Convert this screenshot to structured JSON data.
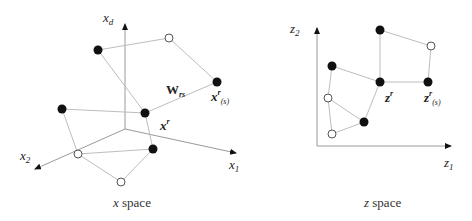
{
  "x_space": {
    "caption": "x space",
    "axes": {
      "xd": {
        "label": "x",
        "sub": "d"
      },
      "x1": {
        "label": "x",
        "sub": "1"
      },
      "x2": {
        "label": "x",
        "sub": "2"
      }
    },
    "weight_label": {
      "text": "W",
      "sub": "rs"
    },
    "xr_label": {
      "text": "x",
      "sup": "r"
    },
    "xrs_label": {
      "text": "x",
      "sup": "r",
      "sub": "(s)"
    }
  },
  "z_space": {
    "caption": "z space",
    "axes": {
      "z1": {
        "label": "z",
        "sub": "1"
      },
      "z2": {
        "label": "z",
        "sub": "2"
      }
    },
    "zr_label": {
      "text": "z",
      "sup": "r"
    },
    "zrs_label": {
      "text": "z",
      "sup": "r",
      "sub": "(s)"
    }
  }
}
